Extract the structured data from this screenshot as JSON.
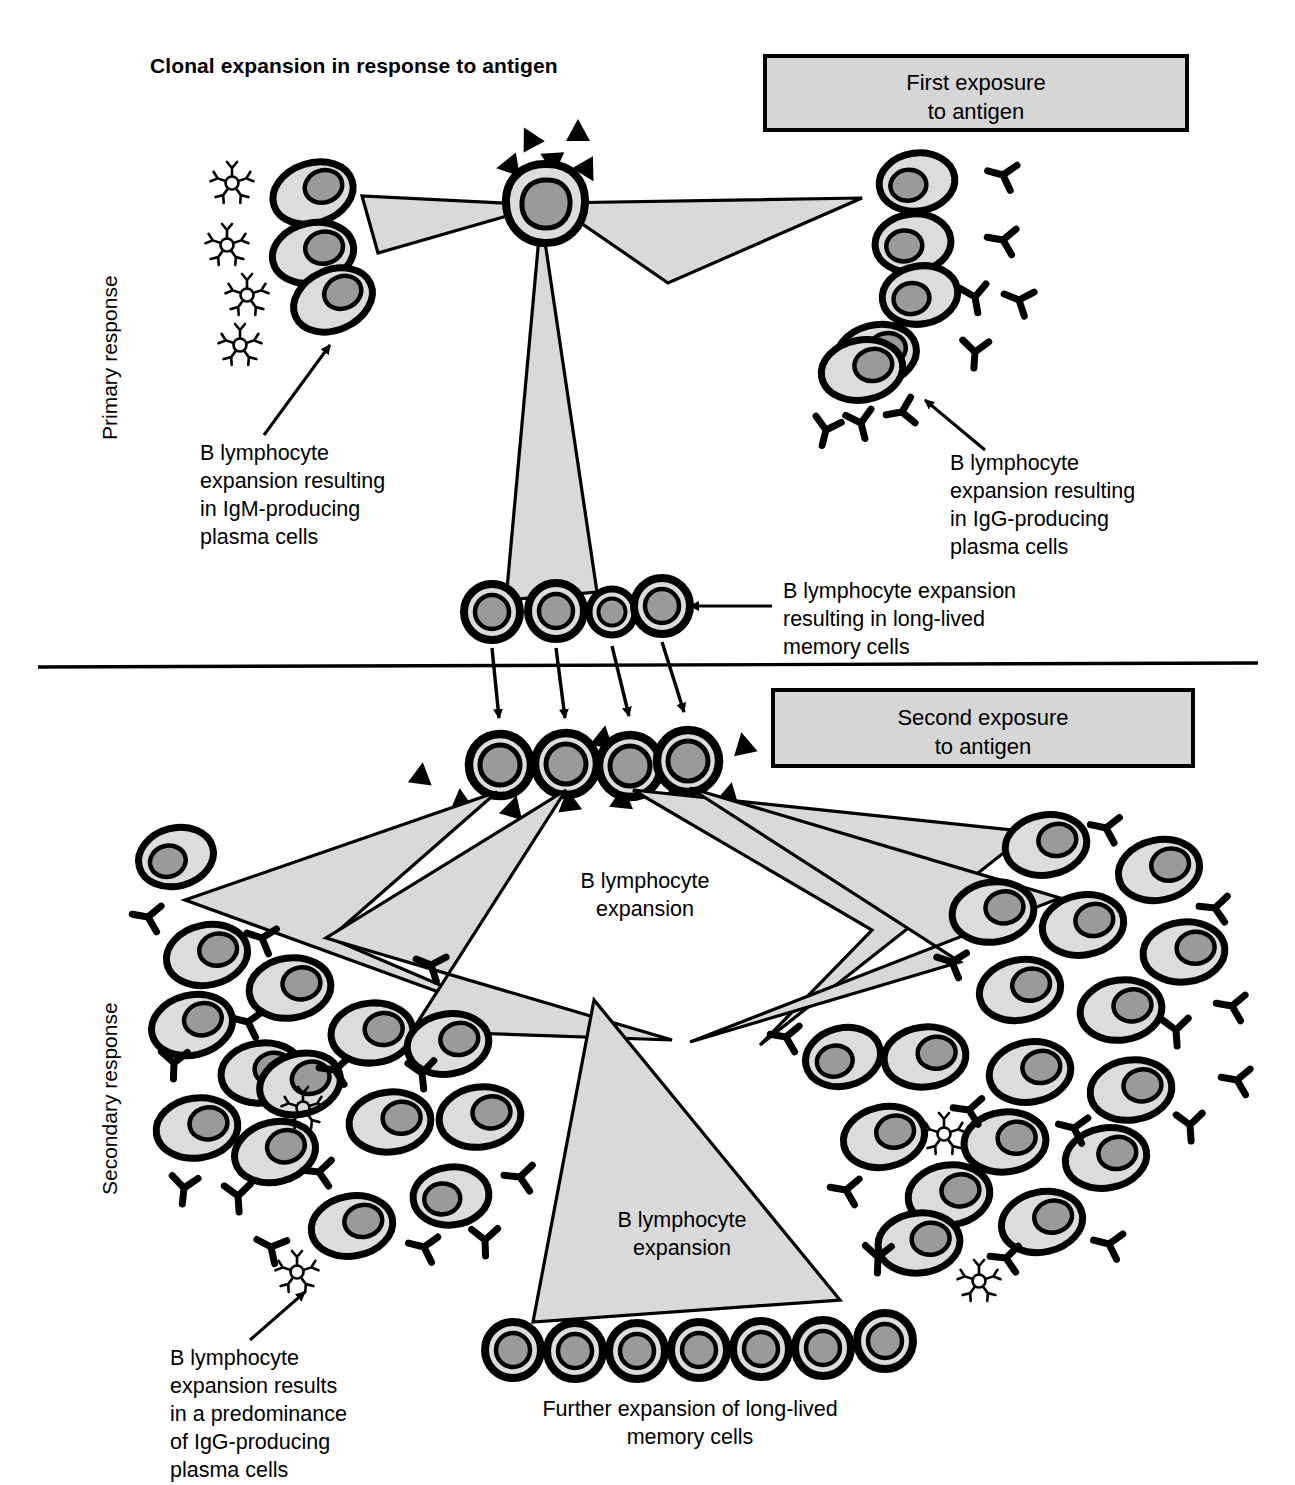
{
  "figure": {
    "title": "Clonal expansion in response to antigen",
    "domain": "immunology-diagram"
  },
  "side_labels": {
    "primary": "Primary response",
    "secondary": "Secondary response"
  },
  "boxes": {
    "first_exposure": "First exposure\nto antigen",
    "second_exposure": "Second exposure\nto antigen"
  },
  "labels": {
    "igm_plasma": "B lymphocyte\nexpansion resulting\nin IgM-producing\nplasma cells",
    "igg_plasma": "B lymphocyte\nexpansion resulting\nin IgG-producing\nplasma cells",
    "memory": "B lymphocyte expansion\nresulting in long-lived\nmemory cells",
    "expansion_upper": "B lymphocyte\nexpansion",
    "expansion_lower": "B lymphocyte\nexpansion",
    "igg_predominance": "B lymphocyte\nexpansion results\nin a predominance\nof IgG-producing\nplasma cells",
    "further_memory": "Further expansion of long-lived\nmemory cells"
  },
  "legend_semantics": {
    "antigen": "solid black triangle",
    "igm": "pentameric star antibody",
    "igg": "Y-shaped antibody",
    "plasma_cell": "oval cell with eccentric nucleus",
    "memory_cell": "round concentric cell with large nucleus"
  },
  "colors": {
    "outline": "#000000",
    "cytoplasm": "#dcdcdc",
    "nucleus": "#9a9a9a",
    "triangle_fill": "#d9d9d9",
    "box_fill": "#d6d6d6",
    "background": "#ffffff"
  },
  "counts": {
    "igm_plasma_cells": 3,
    "igm_stars_primary": 4,
    "igg_plasma_cells_primary": 5,
    "igg_antibodies_primary": 8,
    "memory_cells_primary": 4,
    "memory_cells_second_exposure": 4,
    "memory_cells_bottom": 7,
    "antigen_triangles_first": 5,
    "antigen_triangles_second": 9
  }
}
